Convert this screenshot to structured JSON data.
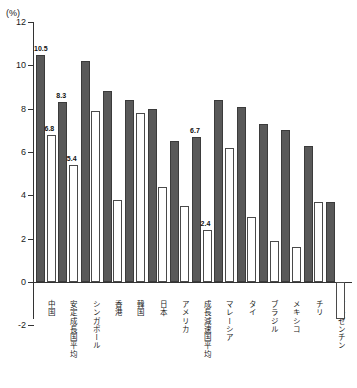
{
  "chart_data": {
    "type": "bar",
    "title": "",
    "subtitle": "",
    "unit_label": "(%)",
    "xlabel": "",
    "ylabel": "",
    "ylim": [
      -2,
      12
    ],
    "ytick_values": [
      12,
      10,
      8,
      6,
      4,
      2,
      0,
      -2
    ],
    "ytick_labels": [
      "12",
      "10",
      "8",
      "6",
      "4",
      "2",
      "0",
      "-2"
    ],
    "grid": false,
    "legend_position": "none",
    "categories": [
      "中国",
      "安定成長国平均",
      "シンガポール",
      "香港",
      "韓国",
      "日本",
      "アメリカ",
      "成長減速国平均",
      "マレーシア",
      "タイ",
      "ブラジル",
      "メキシコ",
      "チリ",
      "アルゼンチン"
    ],
    "series": [
      {
        "name": "dark-series",
        "fill": "#595959",
        "values": [
          10.5,
          8.3,
          10.2,
          8.8,
          8.4,
          8.0,
          6.5,
          6.7,
          8.4,
          8.1,
          7.3,
          7.0,
          6.3,
          3.7
        ]
      },
      {
        "name": "light-series",
        "fill": "#ffffff",
        "values": [
          6.8,
          5.4,
          7.9,
          3.8,
          7.8,
          4.4,
          3.5,
          2.4,
          6.2,
          3.0,
          1.9,
          1.6,
          3.7,
          -1.7
        ]
      }
    ],
    "annotations": [
      {
        "text": "10.5",
        "series": "dark-series",
        "category": "中国"
      },
      {
        "text": "6.8",
        "series": "light-series",
        "category": "中国"
      },
      {
        "text": "8.3",
        "series": "dark-series",
        "category": "安定成長国平均"
      },
      {
        "text": "5.4",
        "series": "light-series",
        "category": "安定成長国平均"
      },
      {
        "text": "6.7",
        "series": "dark-series",
        "category": "成長減速国平均"
      },
      {
        "text": "2.4",
        "series": "light-series",
        "category": "成長減速国平均"
      }
    ],
    "colors": {
      "dark_bar": "#595959",
      "light_bar": "#ffffff",
      "axis": "#333333",
      "text": "#1a1a1a"
    }
  }
}
